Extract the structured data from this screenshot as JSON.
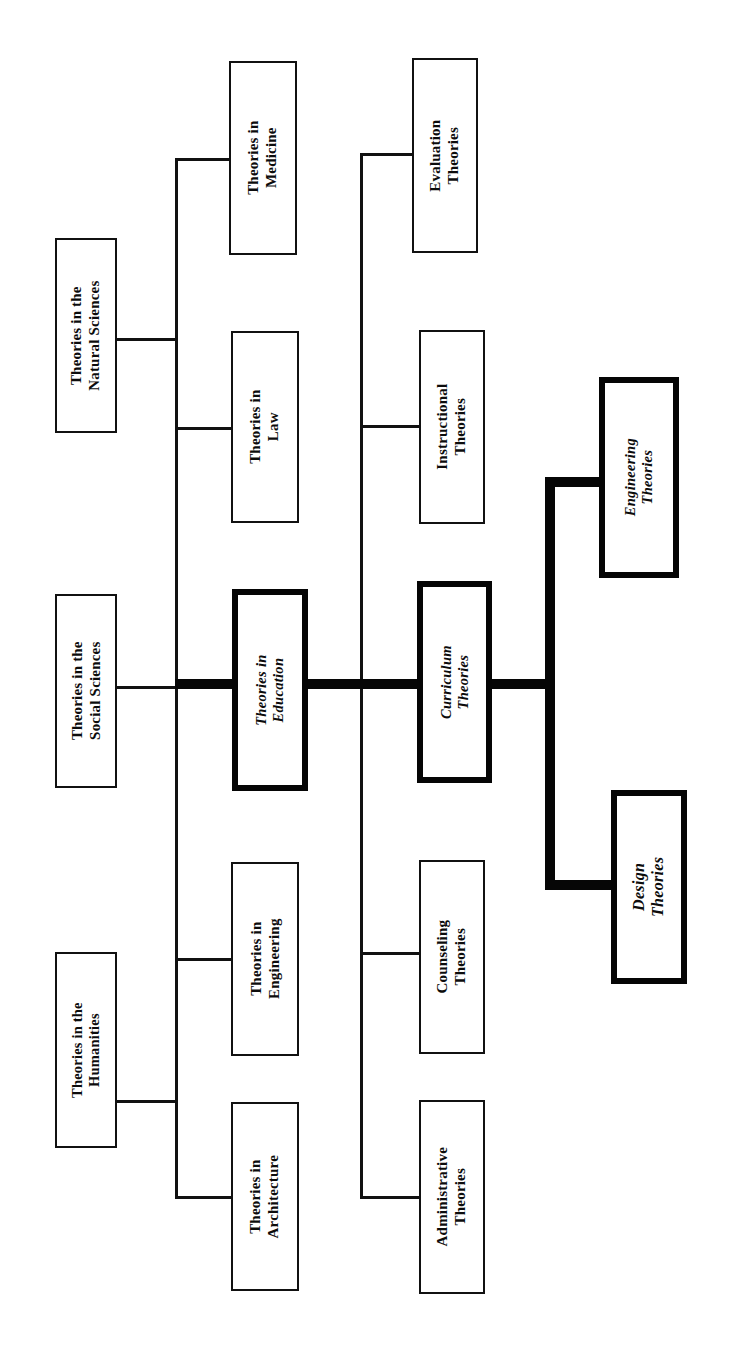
{
  "diagram": {
    "orientation": "rotated-90-ccw",
    "text_direction": "bottom-to-top",
    "colors": {
      "ink": "#111111",
      "emphasis_ink": "#050505",
      "paper": "#ffffff"
    },
    "nodes": [
      {
        "id": "humanities",
        "label": "Theories in the\nHumanities",
        "column": 1,
        "emphasis": false,
        "x": 55,
        "y": 952,
        "w": 62,
        "h": 196
      },
      {
        "id": "social-sciences",
        "label": "Theories in the\nSocial Sciences",
        "column": 1,
        "emphasis": false,
        "x": 55,
        "y": 594,
        "w": 62,
        "h": 194
      },
      {
        "id": "natural-sciences",
        "label": "Theories in the\nNatural Sciences",
        "column": 1,
        "emphasis": false,
        "x": 55,
        "y": 238,
        "w": 62,
        "h": 195
      },
      {
        "id": "architecture",
        "label": "Theories in\nArchitecture",
        "column": 2,
        "emphasis": false,
        "x": 231,
        "y": 1102,
        "w": 68,
        "h": 189
      },
      {
        "id": "engineering",
        "label": "Theories in\nEngineering",
        "column": 2,
        "emphasis": false,
        "x": 231,
        "y": 862,
        "w": 68,
        "h": 194
      },
      {
        "id": "education",
        "label": "Theories in\nEducation",
        "column": 2,
        "emphasis": true,
        "x": 232,
        "y": 589,
        "w": 76,
        "h": 202
      },
      {
        "id": "law",
        "label": "Theories in\nLaw",
        "column": 2,
        "emphasis": false,
        "x": 231,
        "y": 331,
        "w": 68,
        "h": 192
      },
      {
        "id": "medicine",
        "label": "Theories in\nMedicine",
        "column": 2,
        "emphasis": false,
        "x": 229,
        "y": 61,
        "w": 68,
        "h": 194
      },
      {
        "id": "administrative",
        "label": "Administrative\nTheories",
        "column": 3,
        "emphasis": false,
        "x": 419,
        "y": 1100,
        "w": 66,
        "h": 194
      },
      {
        "id": "counseling",
        "label": "Counseling\nTheories",
        "column": 3,
        "emphasis": false,
        "x": 419,
        "y": 860,
        "w": 66,
        "h": 194
      },
      {
        "id": "curriculum",
        "label": "Curriculum\nTheories",
        "column": 3,
        "emphasis": true,
        "x": 417,
        "y": 581,
        "w": 75,
        "h": 202
      },
      {
        "id": "instructional",
        "label": "Instructional\nTheories",
        "column": 3,
        "emphasis": false,
        "x": 419,
        "y": 330,
        "w": 66,
        "h": 194
      },
      {
        "id": "evaluation",
        "label": "Evaluation\nTheories",
        "column": 3,
        "emphasis": false,
        "x": 412,
        "y": 58,
        "w": 66,
        "h": 195
      },
      {
        "id": "design",
        "label": "Design\nTheories",
        "column": 4,
        "emphasis": true,
        "x": 611,
        "y": 790,
        "w": 76,
        "h": 194
      },
      {
        "id": "engineering-th",
        "label": "Engineering\nTheories",
        "column": 4,
        "emphasis": true,
        "x": 599,
        "y": 377,
        "w": 80,
        "h": 201
      }
    ],
    "trunks": [
      {
        "id": "trunk-disciplines",
        "x": 175,
        "y_top": 158,
        "y_bottom": 1196,
        "width": 3,
        "emphasis": false
      },
      {
        "id": "trunk-education",
        "x": 360,
        "y_top": 153,
        "y_bottom": 1198,
        "width": 3,
        "emphasis": false
      },
      {
        "id": "trunk-curriculum",
        "x": 545,
        "y_top": 477,
        "y_bottom": 890,
        "width": 10,
        "emphasis": true
      }
    ],
    "connectors": [
      {
        "id": "c-humanities",
        "from": "humanities",
        "to": "trunk-disciplines",
        "x": 117,
        "y": 1100,
        "w": 58,
        "h": 3,
        "emphasis": false
      },
      {
        "id": "c-social",
        "from": "social-sciences",
        "to": "trunk-disciplines",
        "x": 117,
        "y": 686,
        "w": 58,
        "h": 3,
        "emphasis": false
      },
      {
        "id": "c-natural",
        "from": "natural-sciences",
        "to": "trunk-disciplines",
        "x": 117,
        "y": 338,
        "w": 58,
        "h": 3,
        "emphasis": false
      },
      {
        "id": "c-architecture",
        "from": "trunk-disciplines",
        "to": "architecture",
        "x": 175,
        "y": 1196,
        "w": 57,
        "h": 3,
        "emphasis": false
      },
      {
        "id": "c-engineering",
        "from": "trunk-disciplines",
        "to": "engineering",
        "x": 175,
        "y": 958,
        "w": 57,
        "h": 3,
        "emphasis": false
      },
      {
        "id": "c-education",
        "from": "trunk-disciplines",
        "to": "education",
        "x": 175,
        "y": 679,
        "w": 58,
        "h": 10,
        "emphasis": true
      },
      {
        "id": "c-law",
        "from": "trunk-disciplines",
        "to": "law",
        "x": 175,
        "y": 427,
        "w": 57,
        "h": 3,
        "emphasis": false
      },
      {
        "id": "c-medicine",
        "from": "trunk-disciplines",
        "to": "medicine",
        "x": 175,
        "y": 158,
        "w": 55,
        "h": 3,
        "emphasis": false
      },
      {
        "id": "c-edu-trunk",
        "from": "education",
        "to": "trunk-education",
        "x": 307,
        "y": 679,
        "w": 54,
        "h": 10,
        "emphasis": true
      },
      {
        "id": "c-administrative",
        "from": "trunk-education",
        "to": "administrative",
        "x": 360,
        "y": 1196,
        "w": 60,
        "h": 3,
        "emphasis": false
      },
      {
        "id": "c-counseling",
        "from": "trunk-education",
        "to": "counseling",
        "x": 360,
        "y": 952,
        "w": 60,
        "h": 3,
        "emphasis": false
      },
      {
        "id": "c-curriculum",
        "from": "trunk-education",
        "to": "curriculum",
        "x": 360,
        "y": 679,
        "w": 58,
        "h": 10,
        "emphasis": true
      },
      {
        "id": "c-instructional",
        "from": "trunk-education",
        "to": "instructional",
        "x": 360,
        "y": 425,
        "w": 60,
        "h": 3,
        "emphasis": false
      },
      {
        "id": "c-evaluation",
        "from": "trunk-education",
        "to": "evaluation",
        "x": 360,
        "y": 153,
        "w": 53,
        "h": 3,
        "emphasis": false
      },
      {
        "id": "c-curr-trunk",
        "from": "curriculum",
        "to": "trunk-curriculum",
        "x": 491,
        "y": 679,
        "w": 62,
        "h": 10,
        "emphasis": true
      },
      {
        "id": "c-engineering-th",
        "from": "trunk-curriculum",
        "to": "engineering-th",
        "x": 545,
        "y": 477,
        "w": 58,
        "h": 10,
        "emphasis": true
      },
      {
        "id": "c-design",
        "from": "trunk-curriculum",
        "to": "design",
        "x": 545,
        "y": 880,
        "w": 70,
        "h": 10,
        "emphasis": true
      }
    ]
  }
}
